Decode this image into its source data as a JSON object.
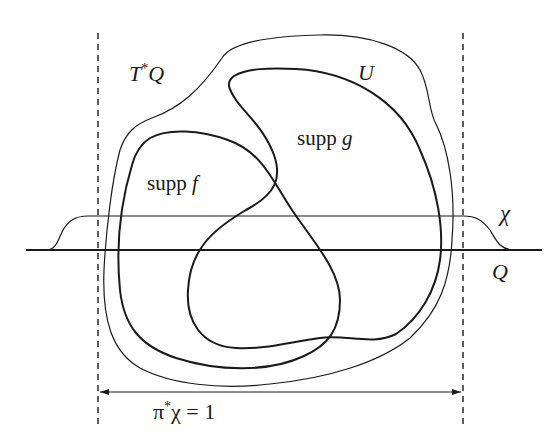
{
  "diagram": {
    "type": "mathematical-support-diagram",
    "colors": {
      "ink": "#1a1a1a",
      "background": "#ffffff"
    },
    "labels": {
      "cotangent_bundle": {
        "base": "T",
        "sup": "*",
        "tail": "Q"
      },
      "open_set": "U",
      "supp_g": {
        "text": "supp ",
        "var": "g"
      },
      "supp_f": {
        "text": "supp ",
        "var": "f"
      },
      "chi": "χ",
      "base_manifold": "Q",
      "pullback_equation": {
        "base": "π",
        "sup": "*",
        "tail": "χ = 1"
      }
    },
    "elements": [
      {
        "name": "base-manifold-line",
        "description": "thick horizontal line Q"
      },
      {
        "name": "cutoff-function-chi",
        "description": "plateau bump function χ"
      },
      {
        "name": "left-dashed-boundary",
        "description": "vertical dashed line"
      },
      {
        "name": "right-dashed-boundary",
        "description": "vertical dashed line"
      },
      {
        "name": "region-U",
        "description": "thin closed curve U"
      },
      {
        "name": "region-supp-f",
        "description": "thick closed curve supp f"
      },
      {
        "name": "region-supp-g",
        "description": "thick closed curve supp g"
      },
      {
        "name": "double-arrow",
        "description": "arrow spanning region where π*χ = 1"
      }
    ]
  }
}
